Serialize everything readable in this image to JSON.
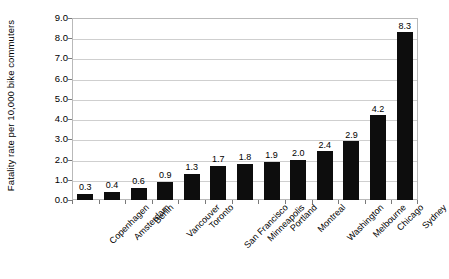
{
  "chart_data": {
    "type": "bar",
    "title": "",
    "subtitle": "",
    "xlabel": "",
    "ylabel": "Fatality rate per 10,000 bike commuters",
    "ylim": [
      0.0,
      9.0
    ],
    "ytick_step": 1.0,
    "ytick_labels": [
      "9.0",
      "8.0",
      "7.0",
      "6.0",
      "5.0",
      "4.0",
      "3.0",
      "2.0",
      "1.0",
      "0.0"
    ],
    "ytick_values": [
      9.0,
      8.0,
      7.0,
      6.0,
      5.0,
      4.0,
      3.0,
      2.0,
      1.0,
      0.0
    ],
    "grid": true,
    "grid_orientation": "horizontal",
    "legend": false,
    "legend_position": "none",
    "bar_color": "#0d0d0d",
    "grid_color": "#cfcfcf",
    "frame_color": "#b9b9b9",
    "data_labels": true,
    "categories": [
      "Copenhagen",
      "Amsterdam",
      "Berlin",
      "Vancouver",
      "Toronto",
      "San Francisco",
      "Minneapolis",
      "Portland",
      "Montreal",
      "Washington",
      "Melbourne",
      "Chicago",
      "Sydney"
    ],
    "values": [
      0.3,
      0.4,
      0.6,
      0.9,
      1.3,
      1.7,
      1.8,
      1.9,
      2.0,
      2.4,
      2.9,
      4.2,
      8.3
    ],
    "value_labels": [
      "0.3",
      "0.4",
      "0.6",
      "0.9",
      "1.3",
      "1.7",
      "1.8",
      "1.9",
      "2.0",
      "2.4",
      "2.9",
      "4.2",
      "8.3"
    ]
  }
}
